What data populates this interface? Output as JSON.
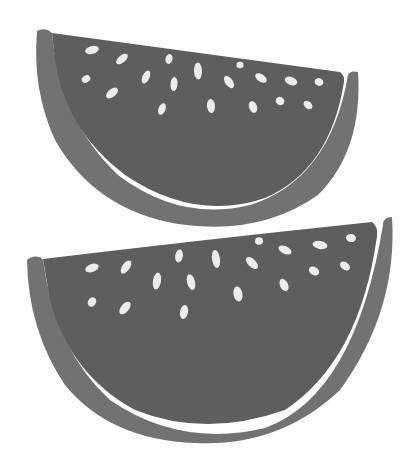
{
  "image": {
    "subject": "Two watermelon slices illustration",
    "width": 415,
    "height": 469,
    "background": "#ffffff"
  },
  "colors": {
    "flesh": "#5e5e5e",
    "rind": "#727272",
    "rind_gap": "#ffffff",
    "seed": "#ececec"
  },
  "slices": [
    {
      "name": "top-slice",
      "rind_path": "M37,31 Q42,28 48,30 L52,33 Q60,120 118,175 Q180,222 250,205 Q330,180 348,75 Q350,70 358,72 Q363,150 318,195 Q260,236 178,224 Q95,210 55,140 Q32,90 37,31 Z",
      "flesh_path": "M52,33 L340,72 Q345,76 344,82 Q330,170 265,198 Q195,222 125,175 Q65,130 55,60 Z",
      "seeds": [
        {
          "cx": 92,
          "cy": 50,
          "rx": 7,
          "ry": 4,
          "rot": -15
        },
        {
          "cx": 122,
          "cy": 59,
          "rx": 7,
          "ry": 3.6,
          "rot": -40
        },
        {
          "cx": 86,
          "cy": 79,
          "rx": 4.5,
          "ry": 3.5,
          "rot": -30
        },
        {
          "cx": 112,
          "cy": 93,
          "rx": 7,
          "ry": 4,
          "rot": -40
        },
        {
          "cx": 146,
          "cy": 77,
          "rx": 7,
          "ry": 3.5,
          "rot": -65
        },
        {
          "cx": 169,
          "cy": 59,
          "rx": 5,
          "ry": 3.5,
          "rot": -75
        },
        {
          "cx": 174,
          "cy": 84,
          "rx": 7,
          "ry": 3.5,
          "rot": -85
        },
        {
          "cx": 198,
          "cy": 71,
          "rx": 8.5,
          "ry": 4,
          "rot": 88
        },
        {
          "cx": 162,
          "cy": 109,
          "rx": 6,
          "ry": 3.5,
          "rot": -70
        },
        {
          "cx": 211,
          "cy": 106,
          "rx": 7,
          "ry": 4,
          "rot": 85
        },
        {
          "cx": 240,
          "cy": 65,
          "rx": 3.5,
          "ry": 3.2,
          "rot": 0
        },
        {
          "cx": 229,
          "cy": 82,
          "rx": 7,
          "ry": 3.8,
          "rot": 55
        },
        {
          "cx": 261,
          "cy": 78,
          "rx": 6.5,
          "ry": 3.8,
          "rot": 35
        },
        {
          "cx": 291,
          "cy": 81,
          "rx": 6.5,
          "ry": 4,
          "rot": 20
        },
        {
          "cx": 319,
          "cy": 82,
          "rx": 4.5,
          "ry": 3.8,
          "rot": 20
        },
        {
          "cx": 253,
          "cy": 107,
          "rx": 6,
          "ry": 4,
          "rot": 70
        },
        {
          "cx": 280,
          "cy": 101,
          "rx": 4.5,
          "ry": 4,
          "rot": 30
        },
        {
          "cx": 308,
          "cy": 105,
          "rx": 5,
          "ry": 3.5,
          "rot": 40
        }
      ]
    },
    {
      "name": "bottom-slice",
      "rind_path": "M27,260 Q32,255 40,257 L43,260 Q55,350 110,400 Q180,448 265,428 Q355,395 383,225 Q383,217 392,217 Q398,310 340,390 Q280,447 195,443 Q110,440 65,385 Q28,330 27,260 Z",
      "flesh_path": "M43,259 Q200,240 372,222 Q378,226 377,236 Q360,360 285,410 Q205,438 135,410 Q70,375 50,300 Z",
      "seeds": [
        {
          "cx": 92,
          "cy": 268,
          "rx": 7,
          "ry": 4,
          "rot": -20
        },
        {
          "cx": 126,
          "cy": 267,
          "rx": 7.5,
          "ry": 3.8,
          "rot": -55
        },
        {
          "cx": 92,
          "cy": 302,
          "rx": 5,
          "ry": 4,
          "rot": -60
        },
        {
          "cx": 125,
          "cy": 308,
          "rx": 7.5,
          "ry": 4,
          "rot": -50
        },
        {
          "cx": 157,
          "cy": 281,
          "rx": 8.5,
          "ry": 4,
          "rot": -80
        },
        {
          "cx": 179,
          "cy": 256,
          "rx": 6.5,
          "ry": 3.8,
          "rot": -80
        },
        {
          "cx": 191,
          "cy": 282,
          "rx": 8,
          "ry": 4,
          "rot": 75
        },
        {
          "cx": 216,
          "cy": 259,
          "rx": 9,
          "ry": 4,
          "rot": 82
        },
        {
          "cx": 184,
          "cy": 312,
          "rx": 7,
          "ry": 4,
          "rot": -80
        },
        {
          "cx": 238,
          "cy": 294,
          "rx": 7.5,
          "ry": 4.5,
          "rot": 80
        },
        {
          "cx": 252,
          "cy": 263,
          "rx": 7.5,
          "ry": 4,
          "rot": 45
        },
        {
          "cx": 259,
          "cy": 241,
          "rx": 4,
          "ry": 3.8,
          "rot": 0
        },
        {
          "cx": 285,
          "cy": 250,
          "rx": 7,
          "ry": 3.8,
          "rot": 25
        },
        {
          "cx": 320,
          "cy": 245,
          "rx": 7.5,
          "ry": 4,
          "rot": 10
        },
        {
          "cx": 351,
          "cy": 238,
          "rx": 5,
          "ry": 4,
          "rot": 10
        },
        {
          "cx": 314,
          "cy": 271,
          "rx": 5.5,
          "ry": 4,
          "rot": 30
        },
        {
          "cx": 345,
          "cy": 266,
          "rx": 5.5,
          "ry": 3.8,
          "rot": 35
        },
        {
          "cx": 284,
          "cy": 285,
          "rx": 6.5,
          "ry": 4,
          "rot": 65
        }
      ]
    }
  ]
}
